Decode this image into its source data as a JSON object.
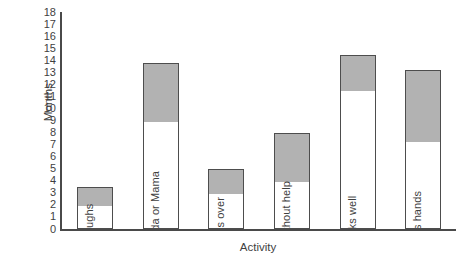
{
  "chart_data": {
    "type": "bar",
    "title": "",
    "xlabel": "Activity",
    "ylabel": "Months",
    "ylim": [
      0,
      18
    ],
    "ytick_labels": [
      "0",
      "1",
      "2",
      "3",
      "4",
      "5",
      "6",
      "7",
      "8",
      "9",
      "10",
      "11",
      "12",
      "13",
      "14",
      "15",
      "16",
      "17",
      "18"
    ],
    "ytick_values": [
      0,
      1,
      2,
      3,
      4,
      5,
      6,
      7,
      8,
      9,
      10,
      11,
      12,
      13,
      14,
      15,
      16,
      17,
      18
    ],
    "grid": false,
    "legend": false,
    "categories": [
      "Laughs",
      "Says Dada or Mama",
      "Rolls over",
      "Sits without help",
      "Walks well",
      "Claps hands"
    ],
    "series": [
      {
        "name": "Lower bound (white segment)",
        "values": [
          2,
          9,
          3,
          4,
          11.5,
          7.3
        ]
      },
      {
        "name": "Upper bound (bar top)",
        "values": [
          3.5,
          13.8,
          5,
          8,
          14.4,
          13.2
        ]
      }
    ],
    "bars": [
      {
        "label": "Laughs",
        "low": 2,
        "high": 3.5
      },
      {
        "label": "Says Dada or Mama",
        "low": 9,
        "high": 13.8
      },
      {
        "label": "Rolls over",
        "low": 3,
        "high": 5
      },
      {
        "label": "Sits without help",
        "low": 4,
        "high": 8
      },
      {
        "label": "Walks well",
        "low": 11.5,
        "high": 14.4
      },
      {
        "label": "Claps hands",
        "low": 7.3,
        "high": 13.2
      }
    ],
    "colors": {
      "bar_fill_lower": "#ffffff",
      "bar_fill_upper": "#b2b2b2",
      "bar_border": "#4d4d4d",
      "axis": "#4a4a4a",
      "text": "#3f3f3f"
    }
  }
}
